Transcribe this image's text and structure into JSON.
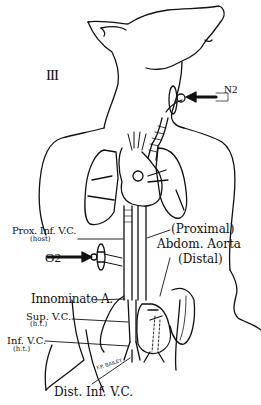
{
  "figure": {
    "panel_label": "III",
    "background_color": "#ffffff",
    "line_color": "#111111"
  },
  "labels": {
    "n2": "N2",
    "o2": "O2",
    "prox_inf_vc": "Prox. Inf. V.C.",
    "prox_inf_vc_sub": "(host)",
    "proximal": "(Proximal)",
    "abdom_aorta": "Abdom. Aorta",
    "distal": "(Distal)",
    "innominate_a": "Innominate A.",
    "sup_vc": "Sup. V.C.",
    "sup_vc_sub": "(h.t.)",
    "inf_vc": "Inf. V.C.",
    "inf_vc_sub": "(h.t.)",
    "dist_inf_vc": "Dist. Inf. V.C.",
    "signature": "F.P. BAILEY"
  },
  "icons": {
    "n2_arrow": "arrow-left-icon",
    "o2_arrow": "arrow-right-icon"
  }
}
